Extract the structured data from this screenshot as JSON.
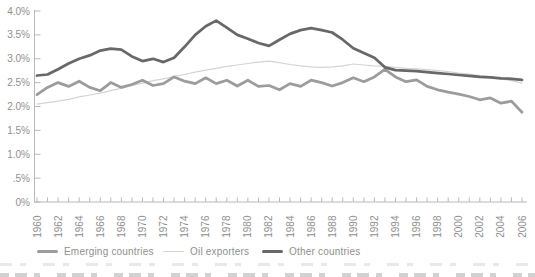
{
  "page": {
    "background": "#ffffff"
  },
  "chart_data": {
    "type": "line",
    "title": "",
    "xlabel": "",
    "ylabel": "",
    "grid": false,
    "x": [
      1960,
      1961,
      1962,
      1963,
      1964,
      1965,
      1966,
      1967,
      1968,
      1969,
      1970,
      1971,
      1972,
      1973,
      1974,
      1975,
      1976,
      1977,
      1978,
      1979,
      1980,
      1981,
      1982,
      1983,
      1984,
      1985,
      1986,
      1987,
      1988,
      1989,
      1990,
      1991,
      1992,
      1993,
      1994,
      1995,
      1996,
      1997,
      1998,
      1999,
      2000,
      2001,
      2002,
      2003,
      2004,
      2005,
      2006
    ],
    "series": [
      {
        "name": "Emerging countries",
        "color": "#9c9c9c",
        "stroke_width": 2.75,
        "values": [
          2.25,
          2.4,
          2.5,
          2.42,
          2.53,
          2.4,
          2.33,
          2.5,
          2.4,
          2.46,
          2.55,
          2.44,
          2.48,
          2.62,
          2.53,
          2.48,
          2.6,
          2.48,
          2.55,
          2.43,
          2.55,
          2.42,
          2.44,
          2.35,
          2.48,
          2.42,
          2.55,
          2.5,
          2.43,
          2.5,
          2.6,
          2.52,
          2.62,
          2.78,
          2.62,
          2.52,
          2.56,
          2.42,
          2.35,
          2.3,
          2.26,
          2.21,
          2.14,
          2.18,
          2.07,
          2.11,
          1.88
        ]
      },
      {
        "name": "Oil exporters",
        "color": "#d4d4d4",
        "stroke_width": 1.2,
        "values": [
          2.05,
          2.08,
          2.11,
          2.15,
          2.2,
          2.24,
          2.28,
          2.33,
          2.38,
          2.44,
          2.49,
          2.54,
          2.58,
          2.63,
          2.67,
          2.72,
          2.76,
          2.8,
          2.84,
          2.87,
          2.9,
          2.93,
          2.95,
          2.92,
          2.88,
          2.85,
          2.83,
          2.82,
          2.83,
          2.85,
          2.89,
          2.87,
          2.85,
          2.84,
          2.82,
          2.8,
          2.79,
          2.77,
          2.75,
          2.73,
          2.7,
          2.68,
          2.65,
          2.62,
          2.58,
          2.54,
          2.49
        ]
      },
      {
        "name": "Other countries",
        "color": "#686868",
        "stroke_width": 2.75,
        "values": [
          2.65,
          2.67,
          2.78,
          2.9,
          3.0,
          3.07,
          3.17,
          3.21,
          3.19,
          3.05,
          2.95,
          3.0,
          2.93,
          3.02,
          3.25,
          3.5,
          3.68,
          3.8,
          3.65,
          3.5,
          3.42,
          3.33,
          3.27,
          3.4,
          3.52,
          3.6,
          3.64,
          3.6,
          3.55,
          3.4,
          3.22,
          3.12,
          3.02,
          2.82,
          2.76,
          2.75,
          2.74,
          2.72,
          2.7,
          2.68,
          2.66,
          2.64,
          2.62,
          2.61,
          2.59,
          2.58,
          2.56
        ]
      }
    ],
    "y_axis": {
      "min": 0,
      "max": 4.0,
      "ticks": [
        {
          "label": "4.0%",
          "value": 4.0
        },
        {
          "label": "3.5%",
          "value": 3.5
        },
        {
          "label": "3.0%",
          "value": 3.0
        },
        {
          "label": "2.5%",
          "value": 2.5
        },
        {
          "label": "2.0%",
          "value": 2.0
        },
        {
          "label": "1.5%",
          "value": 1.5
        },
        {
          "label": "1.0%",
          "value": 1.0
        },
        {
          "label": ".5%",
          "value": 0.5
        },
        {
          "label": "0%",
          "value": 0
        }
      ]
    },
    "x_axis": {
      "min": 1960,
      "max": 2006,
      "tick_every_years": 1,
      "label_every_years": 2,
      "tick_labels": [
        "1960",
        "1962",
        "1964",
        "1966",
        "1968",
        "1970",
        "1972",
        "1974",
        "1976",
        "1978",
        "1980",
        "1982",
        "1984",
        "1986",
        "1988",
        "1990",
        "1992",
        "1994",
        "1996",
        "1998",
        "2000",
        "2002",
        "2004",
        "2006"
      ]
    },
    "legend": {
      "position": "bottom",
      "entries": [
        {
          "label": "Emerging countries",
          "color": "#9c9c9c"
        },
        {
          "label": "Oil exporters",
          "color": "#d4d4d4"
        },
        {
          "label": "Other countries",
          "color": "#686868"
        }
      ]
    },
    "style": {
      "axis_color": "#b8b8b8",
      "label_color": "#8f8f8f",
      "background": "#ffffff"
    }
  }
}
